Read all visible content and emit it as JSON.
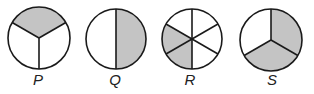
{
  "figure": {
    "shade_color": "#c4c4c4",
    "stroke_color": "#1a1a1a",
    "circles": [
      {
        "label": "P",
        "cx": 39,
        "cy": 38,
        "r": 31,
        "parts": 3,
        "shaded_parts": 1,
        "fraction_shaded": "1/3",
        "spoke_angles_deg": [
          90,
          210,
          330
        ],
        "shaded_sectors": [
          [
            210,
            330
          ]
        ]
      },
      {
        "label": "Q",
        "cx": 116,
        "cy": 39,
        "r": 30,
        "parts": 2,
        "shaded_parts": 1,
        "fraction_shaded": "1/2",
        "spoke_angles_deg": [
          270,
          90
        ],
        "shaded_sectors": [
          [
            270,
            90
          ]
        ]
      },
      {
        "label": "R",
        "cx": 192,
        "cy": 39,
        "r": 30,
        "parts": 6,
        "shaded_parts": 2,
        "fraction_shaded": "2/6",
        "spoke_angles_deg": [
          270,
          330,
          30,
          90,
          150,
          210
        ],
        "shaded_sectors": [
          [
            90,
            150
          ],
          [
            150,
            210
          ]
        ]
      },
      {
        "label": "S",
        "cx": 271,
        "cy": 40,
        "r": 31,
        "parts": 3,
        "shaded_parts": 2,
        "fraction_shaded": "2/3",
        "spoke_angles_deg": [
          270,
          30,
          150
        ],
        "shaded_sectors": [
          [
            270,
            30
          ],
          [
            30,
            150
          ]
        ]
      }
    ],
    "label_y": 85
  }
}
